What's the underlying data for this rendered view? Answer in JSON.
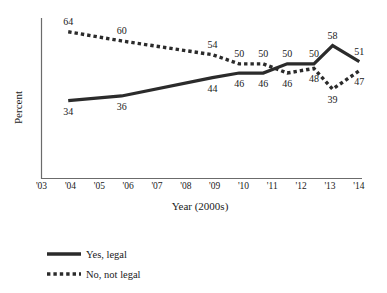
{
  "chart_data": {
    "type": "line",
    "title": "",
    "xlabel": "Year (2000s)",
    "ylabel": "Percent",
    "xlim": [
      2003,
      2015
    ],
    "ylim": [
      0,
      70
    ],
    "grid": false,
    "legend_position": "bottom-left",
    "xtick_labels": [
      "'03",
      "'04",
      "'05",
      "'06",
      "'07",
      "'08",
      "'09",
      "'10",
      "'11",
      "'12",
      "'13",
      "'14"
    ],
    "xtick_values": [
      2003,
      2004,
      2005,
      2006,
      2007,
      2008,
      2009,
      2010,
      2011,
      2012,
      2013,
      2014
    ],
    "series": [
      {
        "name": "Yes, legal",
        "style": "solid",
        "x": [
          2004,
          2006,
          2009.4,
          2010.4,
          2011.3,
          2012.2,
          2013.2,
          2013.9,
          2014.9
        ],
        "values": [
          34,
          36,
          44,
          46,
          46,
          50,
          50,
          58,
          51
        ],
        "point_labels": [
          "34",
          "36",
          "44",
          "46",
          "46",
          "50",
          "50",
          "58",
          "51"
        ],
        "label_positions": [
          "below",
          "below",
          "below",
          "below",
          "below",
          "above",
          "above",
          "above",
          "above"
        ]
      },
      {
        "name": "No, not legal",
        "style": "dotted",
        "x": [
          2004,
          2006,
          2009.4,
          2010.4,
          2011.3,
          2012.2,
          2013.2,
          2013.9,
          2014.9
        ],
        "values": [
          64,
          60,
          54,
          50,
          50,
          46,
          48,
          39,
          47
        ],
        "point_labels": [
          "64",
          "60",
          "54",
          "50",
          "50",
          "46",
          "48",
          "39",
          "47"
        ],
        "label_positions": [
          "above",
          "above",
          "above",
          "above",
          "above",
          "below",
          "below",
          "below",
          "below"
        ]
      }
    ]
  },
  "axis": {
    "y_title": "Percent",
    "x_title": "Year (2000s)"
  },
  "legend": {
    "items": [
      {
        "label": "Yes, legal",
        "style": "solid"
      },
      {
        "label": "No, not legal",
        "style": "dotted"
      }
    ]
  }
}
